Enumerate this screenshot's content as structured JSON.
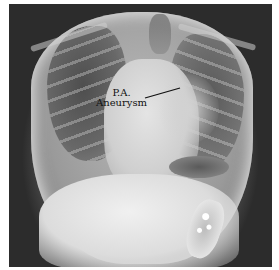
{
  "image": {
    "description": "Posteroanterior chest X-ray radiograph",
    "annotation": {
      "line1": "P.A.",
      "line2": "Aneurysm",
      "pointer": {
        "x1": 145,
        "y1": 98,
        "x2": 180,
        "y2": 88
      }
    },
    "colors": {
      "border": "#ffffff",
      "background": "#2a2a2a",
      "label": "#111111"
    }
  }
}
